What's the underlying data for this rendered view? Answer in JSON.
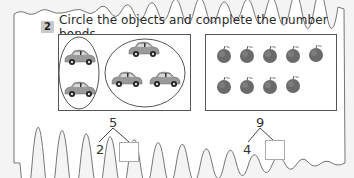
{
  "question": {
    "number": "2",
    "instruction": "Circle the objects and complete the number bonds."
  },
  "panels": [
    {
      "name": "cars",
      "object": "car",
      "groups": [
        {
          "count": 2,
          "circled": true
        },
        {
          "count": 3,
          "circled": true
        }
      ],
      "total": 5,
      "bond": {
        "whole": "5",
        "part_known": "2",
        "part_answer": ""
      }
    },
    {
      "name": "apples",
      "object": "apple",
      "rows": [
        5,
        4
      ],
      "total": 9,
      "bond": {
        "whole": "9",
        "part_known": "4",
        "part_answer": ""
      }
    }
  ],
  "colors": {
    "badge": "#c9c9c9",
    "border": "#555555",
    "car_body": "#9a9a9a",
    "apple": "#6a6a6a"
  }
}
